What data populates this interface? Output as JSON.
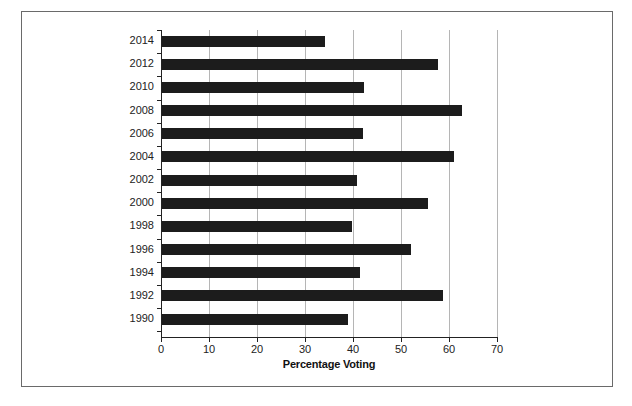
{
  "chart_data": {
    "type": "bar",
    "orientation": "horizontal",
    "title": "",
    "xlabel": "Percentage Voting",
    "ylabel": "",
    "xlim": [
      0,
      70
    ],
    "xticks": [
      0,
      10,
      20,
      30,
      40,
      50,
      60,
      70
    ],
    "grid": "vertical",
    "legend": null,
    "categories": [
      "2014",
      "2012",
      "2010",
      "2008",
      "2006",
      "2004",
      "2002",
      "2000",
      "1998",
      "1996",
      "1994",
      "1992",
      "1990"
    ],
    "values": [
      34.2,
      57.8,
      42.3,
      62.8,
      42.0,
      61.0,
      40.9,
      55.7,
      39.8,
      52.1,
      41.5,
      58.7,
      38.9
    ]
  },
  "colors": {
    "bar": "#1c1c1c",
    "grid": "#b5b5b5",
    "frame": "#6a6a6a"
  }
}
